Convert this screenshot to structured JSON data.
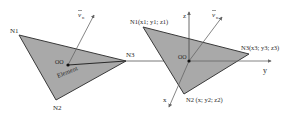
{
  "colors": {
    "fill": "#a9a9a9",
    "stroke": "#3a3a3a",
    "axis": "#666666",
    "background": "#ffffff"
  },
  "left_element": {
    "nodes": {
      "n1": "N1",
      "n2": "N2",
      "n3": "N3"
    },
    "origin": "OO",
    "element_label": "Element",
    "normal_label": "v",
    "normal_subscript": "n"
  },
  "right_element": {
    "nodes": {
      "n1": "N1(x1; y1; z1)",
      "n2": "N2 (x; y2; z2)",
      "n3": "N3(x3; y3; z3)"
    },
    "origin": "OO",
    "normal_label": "v",
    "normal_subscript": "n",
    "axes": {
      "x": "x",
      "y": "y",
      "z": "z"
    }
  }
}
